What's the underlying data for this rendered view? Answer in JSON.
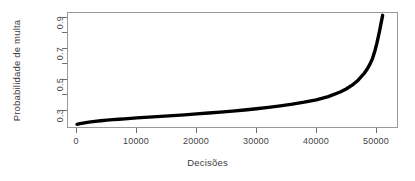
{
  "chart_data": {
    "type": "scatter",
    "title": "",
    "xlabel": "Decisões",
    "ylabel": "Probabilidade de multa",
    "xlim": [
      -1500,
      53500
    ],
    "ylim": [
      0.24,
      0.99
    ],
    "grid": false,
    "legend": null,
    "point_color": "#000000",
    "xticks": [
      0,
      10000,
      20000,
      30000,
      40000,
      50000
    ],
    "xticklabels": [
      "0",
      "10000",
      "20000",
      "30000",
      "40000",
      "50000"
    ],
    "yticks": [
      0.3,
      0.4,
      0.5,
      0.6,
      0.7,
      0.8,
      0.9
    ],
    "yticklabels": [
      "0.3",
      "",
      "0.5",
      "",
      "0.7",
      "",
      "0.9"
    ],
    "series": [
      {
        "name": "Probabilidade de multa ordenada",
        "x": [
          0,
          500,
          1000,
          2000,
          3000,
          4000,
          5000,
          6000,
          7000,
          8000,
          9000,
          10000,
          12000,
          14000,
          16000,
          18000,
          20000,
          22000,
          24000,
          26000,
          28000,
          30000,
          32000,
          34000,
          36000,
          38000,
          40000,
          42000,
          44000,
          45000,
          46000,
          47000,
          48000,
          48500,
          49000,
          49400,
          49800,
          50100,
          50400,
          50600,
          50800,
          50950,
          51050,
          51100
        ],
        "y": [
          0.258,
          0.262,
          0.266,
          0.272,
          0.277,
          0.281,
          0.285,
          0.288,
          0.291,
          0.294,
          0.297,
          0.3,
          0.305,
          0.31,
          0.315,
          0.32,
          0.326,
          0.332,
          0.338,
          0.345,
          0.352,
          0.36,
          0.369,
          0.379,
          0.39,
          0.403,
          0.419,
          0.44,
          0.47,
          0.49,
          0.515,
          0.548,
          0.592,
          0.62,
          0.655,
          0.69,
          0.74,
          0.785,
          0.838,
          0.875,
          0.915,
          0.945,
          0.965,
          0.975
        ]
      }
    ]
  },
  "axes": {
    "y_label": "Probabilidade de multa",
    "x_label": "Decisões",
    "y_tick_labels": [
      "0.3",
      "0.5",
      "0.7",
      "0.9"
    ],
    "x_tick_labels": [
      "0",
      "10000",
      "20000",
      "30000",
      "40000",
      "50000"
    ]
  }
}
